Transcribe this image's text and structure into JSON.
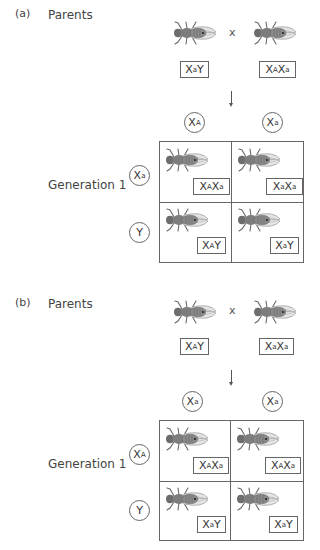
{
  "panels": [
    {
      "id": "a",
      "label": "(a)",
      "parents_label": "Parents",
      "cross_symbol": "x",
      "parents": [
        {
          "base1": "X",
          "sup1": "a",
          "base2": "Y",
          "sup2": ""
        },
        {
          "base1": "X",
          "sup1": "A",
          "base2": "X",
          "sup2": "a"
        }
      ],
      "column_gametes": [
        {
          "base": "X",
          "sup": "A"
        },
        {
          "base": "X",
          "sup": "a"
        }
      ],
      "generation_label": "Generation 1",
      "row_gametes": [
        {
          "base": "X",
          "sup": "a"
        },
        {
          "base": "Y",
          "sup": ""
        }
      ],
      "offspring": [
        {
          "base1": "X",
          "sup1": "A",
          "base2": "X",
          "sup2": "a"
        },
        {
          "base1": "X",
          "sup1": "a",
          "base2": "X",
          "sup2": "a"
        },
        {
          "base1": "X",
          "sup1": "A",
          "base2": "Y",
          "sup2": ""
        },
        {
          "base1": "X",
          "sup1": "a",
          "base2": "Y",
          "sup2": ""
        }
      ]
    },
    {
      "id": "b",
      "label": "(b)",
      "parents_label": "Parents",
      "cross_symbol": "x",
      "parents": [
        {
          "base1": "X",
          "sup1": "A",
          "base2": "Y",
          "sup2": ""
        },
        {
          "base1": "X",
          "sup1": "a",
          "base2": "X",
          "sup2": "a"
        }
      ],
      "column_gametes": [
        {
          "base": "X",
          "sup": "a"
        },
        {
          "base": "X",
          "sup": "a"
        }
      ],
      "generation_label": "Generation 1",
      "row_gametes": [
        {
          "base": "X",
          "sup": "A"
        },
        {
          "base": "Y",
          "sup": ""
        }
      ],
      "offspring": [
        {
          "base1": "X",
          "sup1": "A",
          "base2": "X",
          "sup2": "a"
        },
        {
          "base1": "X",
          "sup1": "A",
          "base2": "X",
          "sup2": "a"
        },
        {
          "base1": "X",
          "sup1": "a",
          "base2": "Y",
          "sup2": ""
        },
        {
          "base1": "X",
          "sup1": "a",
          "base2": "Y",
          "sup2": ""
        }
      ]
    }
  ],
  "colors": {
    "line": "#666666",
    "fly_body": "#7a7a7a",
    "fly_wing": "#bdbdbd",
    "text": "#333333"
  }
}
